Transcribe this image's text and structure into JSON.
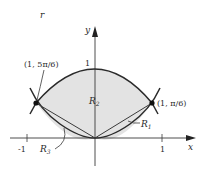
{
  "diagram": {
    "type": "polar-region-diagram",
    "curve_label": "r",
    "axes": {
      "x_label": "x",
      "y_label": "y",
      "x_ticks": [
        "-1",
        "1"
      ],
      "y_tick": "1"
    },
    "points": [
      {
        "label": "(1, 5π/6)",
        "side": "left"
      },
      {
        "label": "(1, π/6)",
        "side": "right"
      }
    ],
    "regions": {
      "r1": {
        "main": "R",
        "sub": "1"
      },
      "r2": {
        "main": "R",
        "sub": "2"
      },
      "r3": {
        "main": "R",
        "sub": "3"
      }
    },
    "colors": {
      "fill": "#e3e3e3",
      "curve": "#2a2a2a",
      "axis": "#3a3a3a",
      "point": "#111111"
    }
  }
}
